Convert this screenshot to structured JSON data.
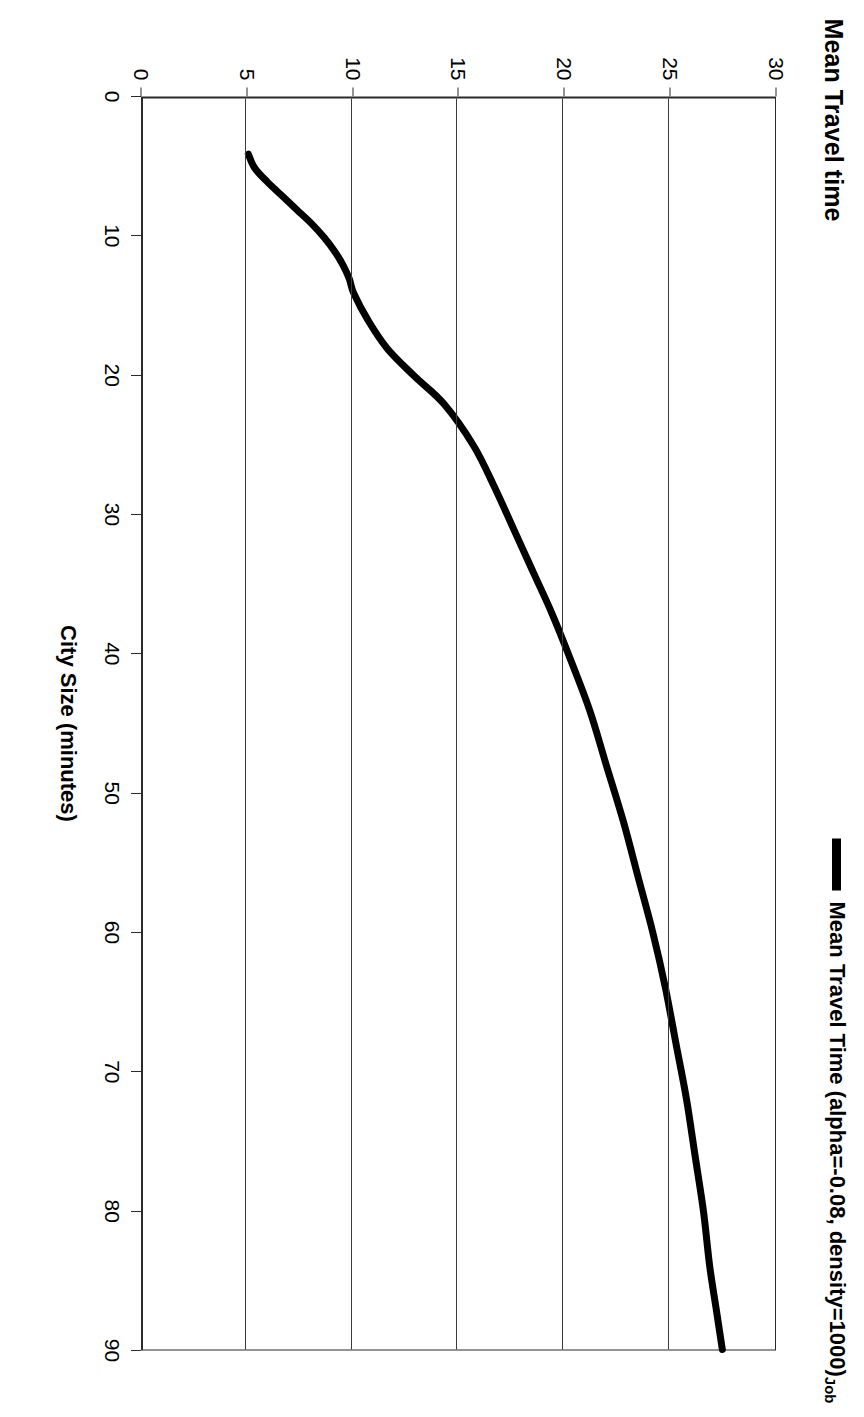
{
  "chart": {
    "title": "Mean Travel time",
    "legend": {
      "entries": [
        {
          "label_main": "Mean Travel Time (alpha=-0.08, density=1000)",
          "label_sub": "Job",
          "color": "#000000"
        }
      ]
    },
    "category_axis": {
      "title": "City Size (minutes)",
      "ticks": [
        "0",
        "10",
        "20",
        "30",
        "40",
        "50",
        "60",
        "70",
        "80",
        "90"
      ],
      "min": 0,
      "max": 90
    },
    "value_axis": {
      "title": "",
      "ticks": [
        "0",
        "5",
        "10",
        "15",
        "20",
        "25",
        "30"
      ],
      "min": 0,
      "max": 30
    },
    "colors": {
      "series": "#000000",
      "axis": "#2b2b2b",
      "grid": "#3a3a3a",
      "background": "#ffffff"
    }
  },
  "chart_data": {
    "type": "line",
    "title": "Mean Travel time",
    "xlabel": "City Size (minutes)",
    "ylabel": "Mean Travel Time",
    "xlim": [
      0,
      90
    ],
    "ylim": [
      0,
      30
    ],
    "xticks": [
      0,
      10,
      20,
      30,
      40,
      50,
      60,
      70,
      80,
      90
    ],
    "yticks": [
      0,
      5,
      10,
      15,
      20,
      25,
      30
    ],
    "grid": "y-gridlines-only",
    "legend_position": "top-right",
    "orientation": "rotated-90-clockwise",
    "series": [
      {
        "name": "Mean Travel Time (alpha=-0.08, density=1000)_Job",
        "color": "#000000",
        "linewidth": 7,
        "x": [
          4,
          5,
          6,
          7,
          8,
          9,
          10,
          11,
          12,
          13,
          14,
          16,
          18,
          20,
          22,
          25,
          28,
          31,
          34,
          37,
          40,
          44,
          48,
          52,
          56,
          60,
          64,
          68,
          72,
          76,
          80,
          84,
          87,
          90
        ],
        "y": [
          5.0,
          5.3,
          5.9,
          6.6,
          7.3,
          8.0,
          8.6,
          9.1,
          9.5,
          9.8,
          10.0,
          10.7,
          11.6,
          12.9,
          14.3,
          15.7,
          16.7,
          17.6,
          18.5,
          19.4,
          20.2,
          21.2,
          22.0,
          22.8,
          23.5,
          24.2,
          24.8,
          25.3,
          25.8,
          26.2,
          26.6,
          26.9,
          27.2,
          27.5
        ]
      }
    ]
  }
}
